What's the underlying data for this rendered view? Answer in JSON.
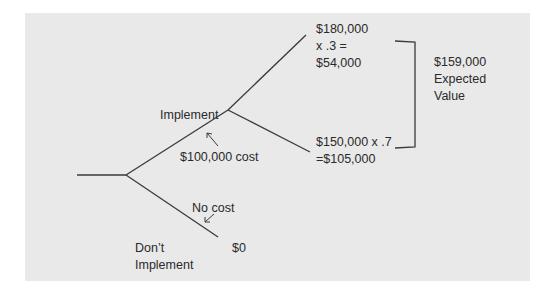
{
  "diagram": {
    "type": "decision-tree",
    "colors": {
      "background": "#e9e9e9",
      "line": "#3a3a3a",
      "text": "#2a2a2a"
    },
    "branches": {
      "implement": {
        "label": "Implement",
        "cost_label": "$100,000 cost",
        "outcomes": [
          {
            "line1": "$180,000",
            "line2": "x .3 =",
            "line3": "$54,000"
          },
          {
            "line1": "$150,000 x .7",
            "line2": "=$105,000"
          }
        ]
      },
      "dont_implement": {
        "label_line1": "Don’t",
        "label_line2": "Implement",
        "cost_label": "No cost",
        "outcome": "$0"
      }
    },
    "expected_value": {
      "amount": "$159,000",
      "label_line1": "Expected",
      "label_line2": "Value"
    }
  }
}
